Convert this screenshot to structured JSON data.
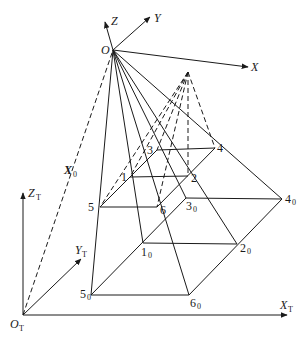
{
  "diagram": {
    "camera_frame": {
      "origin": {
        "label": "O"
      },
      "axes": [
        {
          "label": "X"
        },
        {
          "label": "Y"
        },
        {
          "label": "Z"
        }
      ]
    },
    "world_frame": {
      "origin": {
        "label": "O",
        "sub": "T"
      },
      "axes": [
        {
          "label": "X",
          "sub": "T"
        },
        {
          "label": "Y",
          "sub": "T"
        },
        {
          "label": "Z",
          "sub": "T"
        }
      ]
    },
    "vector_label": {
      "label": "X",
      "sub": "0"
    },
    "image_points": [
      {
        "label": "1"
      },
      {
        "label": "2"
      },
      {
        "label": "3"
      },
      {
        "label": "4"
      },
      {
        "label": "5"
      },
      {
        "label": "6"
      }
    ],
    "ground_points": [
      {
        "label": "1",
        "sub": "0"
      },
      {
        "label": "2",
        "sub": "0"
      },
      {
        "label": "3",
        "sub": "0"
      },
      {
        "label": "4",
        "sub": "0"
      },
      {
        "label": "5",
        "sub": "0"
      },
      {
        "label": "6",
        "sub": "0"
      }
    ],
    "colors": {
      "stroke": "#1a1a1a",
      "background": "#ffffff"
    }
  }
}
